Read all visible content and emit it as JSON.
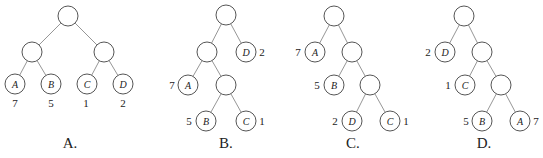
{
  "figure": {
    "node_radius": 10,
    "trees": [
      {
        "option_label": "A.",
        "option_pos": [
          70,
          143
        ],
        "nodes": [
          {
            "id": "r",
            "x": 68,
            "y": 16,
            "label": ""
          },
          {
            "id": "l",
            "x": 32,
            "y": 52,
            "label": ""
          },
          {
            "id": "rr",
            "x": 104,
            "y": 52,
            "label": ""
          },
          {
            "id": "A",
            "x": 15,
            "y": 84,
            "label": "A",
            "weight": "7",
            "weight_pos": [
              15,
              103
            ]
          },
          {
            "id": "B",
            "x": 51,
            "y": 84,
            "label": "B",
            "weight": "5",
            "weight_pos": [
              51,
              103
            ]
          },
          {
            "id": "C",
            "x": 87,
            "y": 84,
            "label": "C",
            "weight": "1",
            "weight_pos": [
              86,
              103
            ]
          },
          {
            "id": "D",
            "x": 123,
            "y": 84,
            "label": "D",
            "weight": "2",
            "weight_pos": [
              123,
              103
            ]
          }
        ],
        "edges": [
          [
            "r",
            "l"
          ],
          [
            "r",
            "rr"
          ],
          [
            "l",
            "A"
          ],
          [
            "l",
            "B"
          ],
          [
            "rr",
            "C"
          ],
          [
            "rr",
            "D"
          ]
        ]
      },
      {
        "option_label": "B.",
        "option_pos": [
          226,
          143
        ],
        "nodes": [
          {
            "id": "r",
            "x": 226,
            "y": 15,
            "label": ""
          },
          {
            "id": "l",
            "x": 207,
            "y": 52,
            "label": ""
          },
          {
            "id": "D",
            "x": 246,
            "y": 52,
            "label": "D",
            "weight": "2",
            "weight_pos": [
              262,
              52
            ]
          },
          {
            "id": "A",
            "x": 188,
            "y": 85,
            "label": "A",
            "weight": "7",
            "weight_pos": [
              172,
              85
            ]
          },
          {
            "id": "m",
            "x": 226,
            "y": 85,
            "label": ""
          },
          {
            "id": "B",
            "x": 206,
            "y": 121,
            "label": "B",
            "weight": "5",
            "weight_pos": [
              189,
              121
            ]
          },
          {
            "id": "C",
            "x": 246,
            "y": 121,
            "label": "C",
            "weight": "1",
            "weight_pos": [
              262,
              121
            ]
          }
        ],
        "edges": [
          [
            "r",
            "l"
          ],
          [
            "r",
            "D"
          ],
          [
            "l",
            "A"
          ],
          [
            "l",
            "m"
          ],
          [
            "m",
            "B"
          ],
          [
            "m",
            "C"
          ]
        ]
      },
      {
        "option_label": "C.",
        "option_pos": [
          353,
          143
        ],
        "nodes": [
          {
            "id": "r",
            "x": 334,
            "y": 16,
            "label": ""
          },
          {
            "id": "A",
            "x": 315,
            "y": 52,
            "label": "A",
            "weight": "7",
            "weight_pos": [
              298,
              52
            ]
          },
          {
            "id": "m1",
            "x": 352,
            "y": 52,
            "label": ""
          },
          {
            "id": "B",
            "x": 334,
            "y": 85,
            "label": "B",
            "weight": "5",
            "weight_pos": [
              317,
              85
            ]
          },
          {
            "id": "m2",
            "x": 370,
            "y": 85,
            "label": ""
          },
          {
            "id": "D",
            "x": 352,
            "y": 121,
            "label": "D",
            "weight": "2",
            "weight_pos": [
              335,
              121
            ]
          },
          {
            "id": "C",
            "x": 390,
            "y": 121,
            "label": "C",
            "weight": "1",
            "weight_pos": [
              406,
              121
            ]
          }
        ],
        "edges": [
          [
            "r",
            "A"
          ],
          [
            "r",
            "m1"
          ],
          [
            "m1",
            "B"
          ],
          [
            "m1",
            "m2"
          ],
          [
            "m2",
            "D"
          ],
          [
            "m2",
            "C"
          ]
        ]
      },
      {
        "option_label": "D.",
        "option_pos": [
          484,
          143
        ],
        "nodes": [
          {
            "id": "r",
            "x": 464,
            "y": 16,
            "label": ""
          },
          {
            "id": "D",
            "x": 445,
            "y": 52,
            "label": "D",
            "weight": "2",
            "weight_pos": [
              428,
              52
            ]
          },
          {
            "id": "m1",
            "x": 482,
            "y": 52,
            "label": ""
          },
          {
            "id": "C",
            "x": 465,
            "y": 85,
            "label": "C",
            "weight": "1",
            "weight_pos": [
              448,
              85
            ]
          },
          {
            "id": "m2",
            "x": 501,
            "y": 85,
            "label": ""
          },
          {
            "id": "B",
            "x": 482,
            "y": 121,
            "label": "B",
            "weight": "5",
            "weight_pos": [
              466,
              121
            ]
          },
          {
            "id": "A",
            "x": 520,
            "y": 121,
            "label": "A",
            "weight": "7",
            "weight_pos": [
              536,
              121
            ]
          }
        ],
        "edges": [
          [
            "r",
            "D"
          ],
          [
            "r",
            "m1"
          ],
          [
            "m1",
            "C"
          ],
          [
            "m1",
            "m2"
          ],
          [
            "m2",
            "B"
          ],
          [
            "m2",
            "A"
          ]
        ]
      }
    ]
  }
}
